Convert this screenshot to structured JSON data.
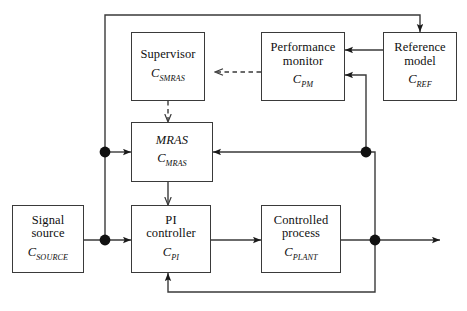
{
  "diagram": {
    "stroke_color": "#3a3a3a",
    "background": "#ffffff",
    "nodes": [
      {
        "id": "supervisor",
        "title": "Supervisor",
        "symbol_base": "C",
        "symbol_sub": "SMRAS",
        "italic_title": false
      },
      {
        "id": "performance-monitor",
        "title": "Performance\nmonitor",
        "symbol_base": "C",
        "symbol_sub": "PM",
        "italic_title": false
      },
      {
        "id": "reference-model",
        "title": "Reference\nmodel",
        "symbol_base": "C",
        "symbol_sub": "REF",
        "italic_title": false
      },
      {
        "id": "mras",
        "title": "MRAS",
        "symbol_base": "C",
        "symbol_sub": "MRAS",
        "italic_title": true
      },
      {
        "id": "signal-source",
        "title": "Signal\nsource",
        "symbol_base": "C",
        "symbol_sub": "SOURCE",
        "italic_title": false
      },
      {
        "id": "pi-controller",
        "title": "PI\ncontroller",
        "symbol_base": "C",
        "symbol_sub": "PI",
        "italic_title": false
      },
      {
        "id": "controlled-process",
        "title": "Controlled\nprocess",
        "symbol_base": "C",
        "symbol_sub": "PLANT",
        "italic_title": false
      }
    ],
    "connections": [
      {
        "from": "signal-source",
        "to": "pi-controller",
        "style": "solid"
      },
      {
        "from": "signal-source-junction",
        "to": "mras",
        "style": "solid"
      },
      {
        "from": "signal-source-junction",
        "to": "reference-model",
        "style": "solid"
      },
      {
        "from": "pi-controller",
        "to": "controlled-process",
        "style": "solid"
      },
      {
        "from": "controlled-process",
        "to": "output",
        "style": "solid"
      },
      {
        "from": "output-junction",
        "to": "mras",
        "style": "solid"
      },
      {
        "from": "output-junction",
        "to": "performance-monitor",
        "style": "solid"
      },
      {
        "from": "output-junction",
        "to": "pi-controller",
        "style": "solid"
      },
      {
        "from": "reference-model",
        "to": "performance-monitor",
        "style": "solid"
      },
      {
        "from": "performance-monitor",
        "to": "supervisor",
        "style": "dashed"
      },
      {
        "from": "supervisor",
        "to": "mras",
        "style": "dashed"
      },
      {
        "from": "mras",
        "to": "pi-controller",
        "style": "solid"
      }
    ]
  }
}
